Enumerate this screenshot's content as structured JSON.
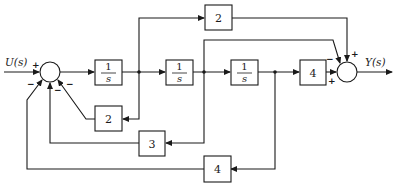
{
  "diagram": {
    "type": "block-diagram",
    "input_label": "U(s)",
    "output_label": "Y(s)",
    "forward_blocks": [
      {
        "id": "int1",
        "numerator": "1",
        "denominator": "s"
      },
      {
        "id": "int2",
        "numerator": "1",
        "denominator": "s"
      },
      {
        "id": "int3",
        "numerator": "1",
        "denominator": "s"
      },
      {
        "id": "gain_fwd",
        "label": "4"
      }
    ],
    "feedforward_block": {
      "id": "gain_top",
      "label": "2"
    },
    "feedback_blocks": [
      {
        "id": "fb2",
        "label": "2"
      },
      {
        "id": "fb3",
        "label": "3"
      },
      {
        "id": "fb4",
        "label": "4"
      }
    ],
    "left_sum_signs": {
      "input": "+",
      "fb_left": "−",
      "fb_mid": "−",
      "fb_right": "−"
    },
    "right_sum_signs": {
      "top": "+",
      "upper_left": "−",
      "left": "+"
    }
  }
}
